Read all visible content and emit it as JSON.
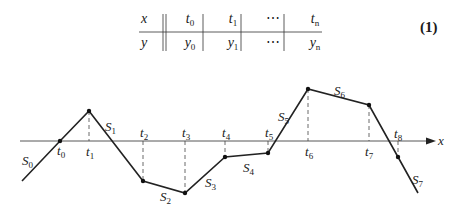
{
  "table": {
    "row_headers": [
      "x",
      "y"
    ],
    "row_x": [
      {
        "b": "t",
        "s": "0"
      },
      {
        "b": "t",
        "s": "1"
      },
      {
        "b": "⋯",
        "s": ""
      },
      {
        "b": "t",
        "s": "n"
      }
    ],
    "row_y": [
      {
        "b": "y",
        "s": "0"
      },
      {
        "b": "y",
        "s": "1"
      },
      {
        "b": "⋯",
        "s": ""
      },
      {
        "b": "y",
        "s": "n"
      }
    ]
  },
  "equation_number": "(1)",
  "axis_label": "x",
  "knots": [
    {
      "name": "t",
      "sub": "0",
      "x": 60,
      "y": 141
    },
    {
      "name": "t",
      "sub": "1",
      "x": 89,
      "y": 111
    },
    {
      "name": "t",
      "sub": "2",
      "x": 143,
      "y": 181
    },
    {
      "name": "t",
      "sub": "3",
      "x": 185,
      "y": 193
    },
    {
      "name": "t",
      "sub": "4",
      "x": 225,
      "y": 157
    },
    {
      "name": "t",
      "sub": "5",
      "x": 268,
      "y": 153
    },
    {
      "name": "t",
      "sub": "6",
      "x": 308,
      "y": 89
    },
    {
      "name": "t",
      "sub": "7",
      "x": 369,
      "y": 105
    },
    {
      "name": "t",
      "sub": "8",
      "x": 398,
      "y": 157
    }
  ],
  "segments": [
    {
      "name": "S",
      "sub": "0",
      "x": 18,
      "y": 152
    },
    {
      "name": "S",
      "sub": "1",
      "x": 104,
      "y": 120
    },
    {
      "name": "S",
      "sub": "2",
      "x": 161,
      "y": 190
    },
    {
      "name": "S",
      "sub": "3",
      "x": 205,
      "y": 175
    },
    {
      "name": "S",
      "sub": "4",
      "x": 241,
      "y": 158
    },
    {
      "name": "S",
      "sub": "5",
      "x": 278,
      "y": 108
    },
    {
      "name": "S",
      "sub": "6",
      "x": 333,
      "y": 83
    },
    {
      "name": "S",
      "sub": "7",
      "x": 411,
      "y": 172
    }
  ]
}
